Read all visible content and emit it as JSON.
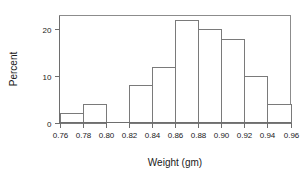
{
  "chart_data": {
    "type": "bar",
    "title": "",
    "subtitle": "",
    "xlabel": "Weight (gm)",
    "ylabel": "Percent",
    "xlim": [
      0.76,
      0.96
    ],
    "ylim": [
      0,
      23
    ],
    "grid": false,
    "legend": null,
    "bin_width": 0.02,
    "bin_edges": [
      0.76,
      0.78,
      0.8,
      0.82,
      0.84,
      0.86,
      0.88,
      0.9,
      0.92,
      0.94,
      0.96
    ],
    "categories": [
      "0.76-0.78",
      "0.78-0.80",
      "0.80-0.82",
      "0.82-0.84",
      "0.84-0.86",
      "0.86-0.88",
      "0.88-0.90",
      "0.90-0.92",
      "0.92-0.94",
      "0.94-0.96"
    ],
    "values": [
      2,
      4,
      0,
      8,
      12,
      22,
      20,
      18,
      10,
      4
    ],
    "xticks": [
      0.76,
      0.78,
      0.8,
      0.82,
      0.84,
      0.86,
      0.88,
      0.9,
      0.92,
      0.94,
      0.96
    ],
    "xtick_labels": [
      "0.76",
      "0.78",
      "0.80",
      "0.82",
      "0.84",
      "0.86",
      "0.88",
      "0.90",
      "0.92",
      "0.94",
      "0.96"
    ],
    "yticks": [
      0,
      10,
      20
    ],
    "ytick_labels": [
      "0",
      "10",
      "20"
    ],
    "colors": {
      "bar_fill": "#ffffff",
      "bar_stroke": "#7a7a7a",
      "axis": "#6e6e6e",
      "frame": "#8c8c8c",
      "text": "#1a1a1a",
      "background": "#ffffff"
    }
  }
}
